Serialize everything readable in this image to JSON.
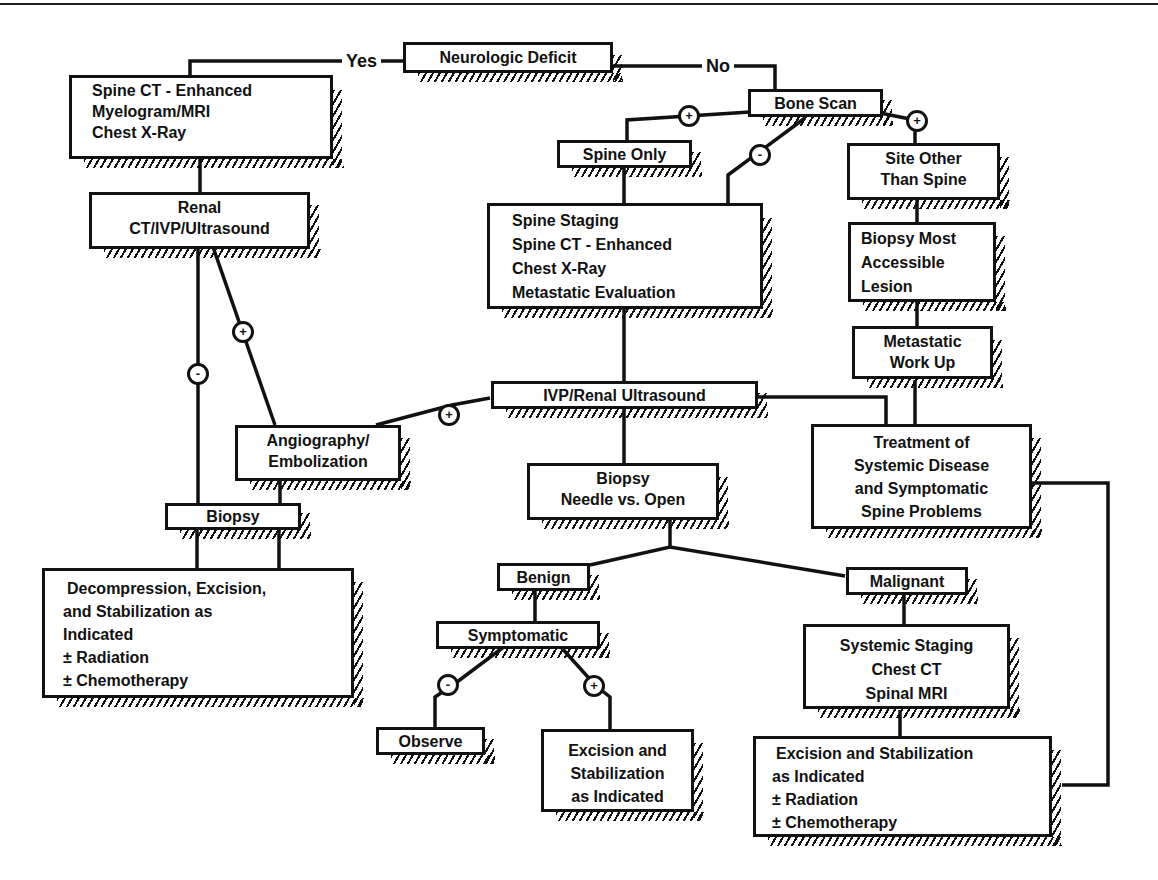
{
  "diagram": {
    "type": "flowchart",
    "branch_labels": {
      "yes": "Yes",
      "no": "No"
    },
    "signs": {
      "positive": "+",
      "negative": "-"
    },
    "nodes": {
      "neurologic_deficit": {
        "lines": [
          "Neurologic Deficit"
        ]
      },
      "spine_ct_left": {
        "lines": [
          "Spine CT - Enhanced",
          "Myelogram/MRI",
          "Chest X-Ray"
        ]
      },
      "renal": {
        "lines": [
          "Renal",
          "CT/IVP/Ultrasound"
        ]
      },
      "angiography": {
        "lines": [
          "Angiography/",
          "Embolization"
        ]
      },
      "biopsy_left": {
        "lines": [
          "Biopsy"
        ]
      },
      "decompression": {
        "lines": [
          "Decompression, Excision,",
          "and Stabilization as",
          "Indicated",
          "± Radiation",
          "± Chemotherapy"
        ]
      },
      "bone_scan": {
        "lines": [
          "Bone Scan"
        ]
      },
      "spine_only": {
        "lines": [
          "Spine Only"
        ]
      },
      "site_other": {
        "lines": [
          "Site Other",
          "Than Spine"
        ]
      },
      "spine_staging": {
        "lines": [
          "Spine Staging",
          "Spine CT - Enhanced",
          "Chest X-Ray",
          "Metastatic Evaluation"
        ]
      },
      "biopsy_most": {
        "lines": [
          "Biopsy Most",
          "Accessible",
          "Lesion"
        ]
      },
      "metastatic_workup": {
        "lines": [
          "Metastatic",
          "Work Up"
        ]
      },
      "ivp_renal": {
        "lines": [
          "IVP/Renal Ultrasound"
        ]
      },
      "treatment_systemic": {
        "lines": [
          "Treatment of",
          "Systemic Disease",
          "and Symptomatic",
          "Spine Problems"
        ]
      },
      "biopsy_needle": {
        "lines": [
          "Biopsy",
          "Needle vs. Open"
        ]
      },
      "benign": {
        "lines": [
          "Benign"
        ]
      },
      "malignant": {
        "lines": [
          "Malignant"
        ]
      },
      "symptomatic": {
        "lines": [
          "Symptomatic"
        ]
      },
      "observe": {
        "lines": [
          "Observe"
        ]
      },
      "excision_benign": {
        "lines": [
          "Excision and",
          "Stabilization",
          "as Indicated"
        ]
      },
      "systemic_staging": {
        "lines": [
          "Systemic Staging",
          "Chest CT",
          "Spinal MRI"
        ]
      },
      "excision_malignant": {
        "lines": [
          "Excision and Stabilization",
          "as Indicated",
          "± Radiation",
          "± Chemotherapy"
        ]
      }
    },
    "edges": [
      {
        "from": "neurologic_deficit",
        "to": "spine_ct_left",
        "label": "Yes"
      },
      {
        "from": "neurologic_deficit",
        "to": "bone_scan",
        "label": "No"
      },
      {
        "from": "spine_ct_left",
        "to": "renal"
      },
      {
        "from": "renal",
        "to": "biopsy_left",
        "sign": "-"
      },
      {
        "from": "renal",
        "to": "angiography",
        "sign": "+"
      },
      {
        "from": "angiography",
        "to": "biopsy_left"
      },
      {
        "from": "biopsy_left",
        "to": "decompression"
      },
      {
        "from": "bone_scan",
        "to": "spine_only",
        "sign": "+"
      },
      {
        "from": "bone_scan",
        "to": "spine_staging",
        "sign": "-"
      },
      {
        "from": "bone_scan",
        "to": "site_other",
        "sign": "+"
      },
      {
        "from": "spine_only",
        "to": "spine_staging"
      },
      {
        "from": "site_other",
        "to": "biopsy_most"
      },
      {
        "from": "biopsy_most",
        "to": "metastatic_workup"
      },
      {
        "from": "metastatic_workup",
        "to": "treatment_systemic"
      },
      {
        "from": "spine_staging",
        "to": "ivp_renal"
      },
      {
        "from": "ivp_renal",
        "to": "angiography",
        "sign": "+"
      },
      {
        "from": "ivp_renal",
        "to": "treatment_systemic"
      },
      {
        "from": "ivp_renal",
        "to": "biopsy_needle"
      },
      {
        "from": "biopsy_needle",
        "to": "benign"
      },
      {
        "from": "biopsy_needle",
        "to": "malignant"
      },
      {
        "from": "benign",
        "to": "symptomatic"
      },
      {
        "from": "symptomatic",
        "to": "observe",
        "sign": "-"
      },
      {
        "from": "symptomatic",
        "to": "excision_benign",
        "sign": "+"
      },
      {
        "from": "malignant",
        "to": "systemic_staging"
      },
      {
        "from": "systemic_staging",
        "to": "excision_malignant"
      },
      {
        "from": "treatment_systemic",
        "to": "excision_malignant"
      }
    ]
  }
}
